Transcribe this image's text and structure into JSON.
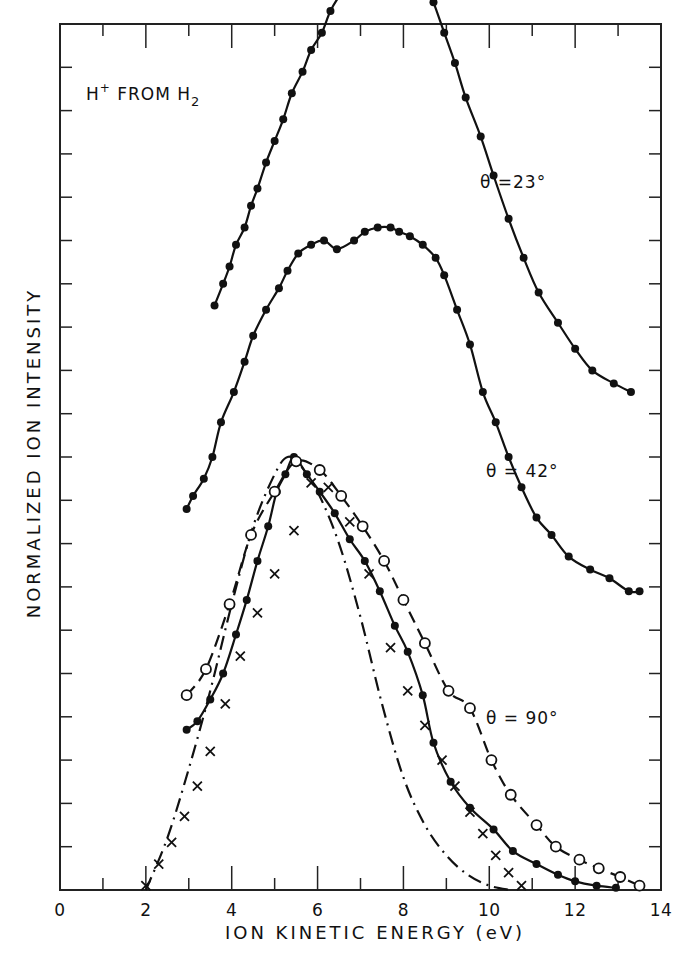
{
  "chart_data": {
    "type": "line",
    "title": "H+ FROM H2",
    "annotation": {
      "main": "H",
      "sup": "+",
      "mid": " FROM H",
      "sub": "2"
    },
    "xlabel": "ION KINETIC ENERGY (eV)",
    "ylabel": "NORMALIZED ION INTENSITY",
    "xlim": [
      0,
      14
    ],
    "ylim": [
      0,
      20
    ],
    "x_ticks": [
      "0",
      "2",
      "4",
      "6",
      "8",
      "10",
      "12",
      "14"
    ],
    "y_ticks_labeled": false,
    "grid": false,
    "legend_position": "inline annotations",
    "frame": {
      "left": 60,
      "right": 661,
      "top": 24,
      "bottom": 890
    },
    "curve_labels": [
      {
        "text": "θ =23°",
        "x": 9.7,
        "y": 16.3
      },
      {
        "text": "θ = 42°",
        "x": 9.7,
        "y": 9.4
      },
      {
        "text": "θ = 90°",
        "x": 9.6,
        "y": 3.9
      }
    ],
    "series": [
      {
        "name": "θ = 23°",
        "style": "solid line, filled circles",
        "x": [
          3.6,
          3.8,
          3.95,
          4.1,
          4.3,
          4.45,
          4.6,
          4.8,
          5.0,
          5.2,
          5.4,
          5.65,
          5.85,
          6.1,
          6.3,
          6.55,
          6.85,
          7.15,
          7.45,
          7.7,
          7.95,
          8.15,
          8.45,
          8.7,
          8.95,
          9.2,
          9.45,
          9.8,
          10.1,
          10.45,
          10.8,
          11.15,
          11.6,
          12.0,
          12.4,
          12.9,
          13.3
        ],
        "y": [
          13.5,
          14.0,
          14.4,
          14.9,
          15.3,
          15.8,
          16.2,
          16.8,
          17.3,
          17.8,
          18.4,
          18.9,
          19.4,
          19.8,
          20.3,
          20.7,
          21.0,
          21.3,
          21.7,
          21.9,
          21.8,
          21.4,
          21.1,
          20.5,
          19.8,
          19.1,
          18.3,
          17.4,
          16.5,
          15.5,
          14.6,
          13.8,
          13.1,
          12.5,
          12.0,
          11.7,
          11.5
        ]
      },
      {
        "name": "θ = 42°",
        "style": "solid line, filled circles",
        "x": [
          2.95,
          3.1,
          3.35,
          3.55,
          3.75,
          4.05,
          4.3,
          4.5,
          4.8,
          5.1,
          5.3,
          5.55,
          5.85,
          6.15,
          6.45,
          6.85,
          7.1,
          7.4,
          7.7,
          7.9,
          8.15,
          8.45,
          8.75,
          8.95,
          9.25,
          9.55,
          9.85,
          10.15,
          10.45,
          10.75,
          11.1,
          11.45,
          11.85,
          12.35,
          12.8,
          13.25,
          13.5
        ],
        "y": [
          8.8,
          9.1,
          9.5,
          10.0,
          10.8,
          11.5,
          12.2,
          12.8,
          13.4,
          13.9,
          14.3,
          14.7,
          14.9,
          15.0,
          14.8,
          15.0,
          15.2,
          15.3,
          15.3,
          15.2,
          15.1,
          14.9,
          14.6,
          14.2,
          13.4,
          12.6,
          11.5,
          10.8,
          10.0,
          9.3,
          8.6,
          8.2,
          7.7,
          7.4,
          7.2,
          6.9,
          6.9
        ]
      },
      {
        "name": "θ = 90° (filled circles, solid)",
        "style": "solid line, filled circles",
        "x": [
          2.95,
          3.2,
          3.5,
          3.8,
          4.1,
          4.35,
          4.6,
          4.85,
          5.05,
          5.25,
          5.45,
          5.75,
          6.05,
          6.4,
          6.75,
          7.1,
          7.45,
          7.8,
          8.1,
          8.45,
          8.7,
          9.1,
          9.55,
          10.1,
          10.55,
          11.1,
          11.6,
          12.0,
          12.5,
          12.95
        ],
        "y": [
          3.7,
          3.9,
          4.4,
          5.0,
          5.9,
          6.7,
          7.6,
          8.4,
          9.2,
          9.6,
          10.0,
          9.6,
          9.2,
          8.7,
          8.1,
          7.6,
          6.9,
          6.1,
          5.5,
          4.5,
          3.4,
          2.5,
          1.9,
          1.4,
          0.9,
          0.6,
          0.35,
          0.2,
          0.1,
          0.05
        ]
      },
      {
        "name": "θ = 90° (open circles, dashed)",
        "style": "dashed line, open circles",
        "x": [
          2.95,
          3.4,
          3.95,
          4.45,
          5.0,
          5.5,
          6.05,
          6.55,
          7.05,
          7.55,
          8.0,
          8.5,
          9.05,
          9.55,
          10.05,
          10.5,
          11.1,
          11.55,
          12.1,
          12.55,
          13.05,
          13.5
        ],
        "y": [
          4.5,
          5.1,
          6.6,
          8.2,
          9.2,
          9.9,
          9.7,
          9.1,
          8.4,
          7.6,
          6.7,
          5.7,
          4.6,
          4.2,
          3.0,
          2.2,
          1.5,
          1.0,
          0.7,
          0.5,
          0.3,
          0.1
        ]
      },
      {
        "name": "θ = 90° (crosses)",
        "style": "crosses, dash-dot line",
        "x": [
          2.0,
          2.3,
          2.6,
          2.9,
          3.2,
          3.5,
          3.85,
          4.2,
          4.6,
          5.0,
          5.45,
          5.85,
          6.25,
          6.75,
          7.2,
          7.7,
          8.1,
          8.5,
          8.9,
          9.2,
          9.55,
          9.85,
          10.15,
          10.45,
          10.75
        ],
        "y": [
          0.1,
          0.6,
          1.1,
          1.7,
          2.4,
          3.2,
          4.3,
          5.4,
          6.4,
          7.3,
          8.3,
          9.4,
          9.3,
          8.5,
          7.3,
          5.6,
          4.6,
          3.8,
          3.0,
          2.4,
          1.8,
          1.3,
          0.8,
          0.4,
          0.1
        ]
      },
      {
        "name": "θ = 90° (dash-dot curve)",
        "style": "dash-dot line, no markers",
        "x": [
          2.0,
          2.5,
          3.0,
          3.5,
          4.0,
          4.5,
          5.0,
          5.3,
          5.6,
          6.0,
          6.5,
          7.0,
          7.5,
          8.0,
          8.5,
          9.0,
          9.5,
          10.0,
          10.5
        ],
        "y": [
          0.0,
          1.2,
          2.8,
          4.6,
          6.6,
          8.4,
          9.6,
          10.0,
          9.8,
          9.2,
          8.0,
          6.3,
          4.3,
          2.6,
          1.5,
          0.8,
          0.35,
          0.1,
          0.0
        ]
      }
    ]
  }
}
